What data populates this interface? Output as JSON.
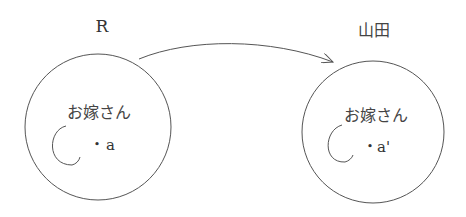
{
  "diagram": {
    "left": {
      "label": "R",
      "inner_text": "お嫁さん",
      "point_label": "a",
      "bullet": "•"
    },
    "right": {
      "label": "山田",
      "inner_text": "お嫁さん",
      "point_label": "a'",
      "bullet": "•"
    },
    "arrow": {
      "from": "R",
      "to": "山田"
    },
    "colors": {
      "stroke": "#555555",
      "text": "#333333",
      "background": "#ffffff"
    }
  }
}
